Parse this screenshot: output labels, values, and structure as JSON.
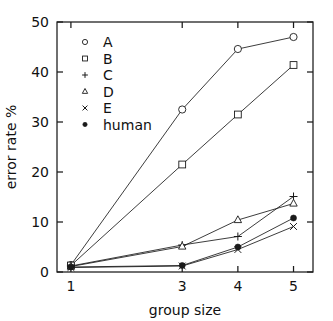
{
  "chart_data": {
    "type": "line",
    "title": "",
    "subtitle": "",
    "xlabel": "group size",
    "ylabel": "error rate %",
    "x": [
      1,
      3,
      4,
      5
    ],
    "xlim": [
      0.75,
      5.35
    ],
    "ylim": [
      0,
      50
    ],
    "xticks": [
      1,
      3,
      4,
      5
    ],
    "xtick_labels": [
      "1",
      "3",
      "4",
      "5"
    ],
    "yticks": [
      0,
      10,
      20,
      30,
      40,
      50
    ],
    "ytick_labels": [
      "0",
      "10",
      "20",
      "30",
      "40",
      "50"
    ],
    "grid": false,
    "legend_position": "top-left",
    "frame": "box",
    "tick_direction": "in",
    "series": [
      {
        "name": "A",
        "marker": "open-circle",
        "x": [
          1,
          3,
          4,
          5
        ],
        "values": [
          1.4,
          32.5,
          44.6,
          47.0
        ]
      },
      {
        "name": "B",
        "marker": "open-square",
        "x": [
          1,
          3,
          4,
          5
        ],
        "values": [
          1.3,
          21.5,
          31.5,
          41.4
        ]
      },
      {
        "name": "C",
        "marker": "plus",
        "x": [
          1,
          3,
          4,
          5
        ],
        "values": [
          1.2,
          5.4,
          7.1,
          15.1
        ]
      },
      {
        "name": "D",
        "marker": "open-triangle",
        "x": [
          1,
          3,
          4,
          5
        ],
        "values": [
          1.1,
          5.1,
          10.4,
          13.7
        ]
      },
      {
        "name": "E",
        "marker": "cross",
        "x": [
          1,
          3,
          4,
          5
        ],
        "values": [
          0.9,
          1.2,
          4.5,
          9.1
        ]
      },
      {
        "name": "human",
        "marker": "filled-circle",
        "x": [
          1,
          3,
          4,
          5
        ],
        "values": [
          1.0,
          1.3,
          5.0,
          10.8
        ]
      }
    ],
    "legend": [
      {
        "label": "A",
        "marker": "open-circle"
      },
      {
        "label": "B",
        "marker": "open-square"
      },
      {
        "label": "C",
        "marker": "plus"
      },
      {
        "label": "D",
        "marker": "open-triangle"
      },
      {
        "label": "E",
        "marker": "cross"
      },
      {
        "label": "human",
        "marker": "filled-circle"
      }
    ]
  }
}
